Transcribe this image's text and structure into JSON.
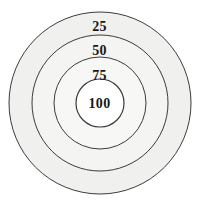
{
  "figure": {
    "type": "concentric-target-diagram",
    "background_color": "#ffffff",
    "stroke_color": "#3b3b3b",
    "canvas": {
      "width": 199,
      "height": 205
    }
  },
  "chart_data": {
    "type": "pie",
    "title": "",
    "subtitle": "",
    "xlabel": "",
    "ylabel": "",
    "legend": "none",
    "grid": false,
    "center": {
      "x": 100,
      "y": 103
    },
    "categories": [
      "25",
      "50",
      "75",
      "100"
    ],
    "values": [
      25,
      50,
      75,
      100
    ],
    "rings": [
      {
        "label": "25",
        "zone": "outermost",
        "radius": 91,
        "fill": "#f0f0ee",
        "stroke": "#3b3b3b",
        "label_position": {
          "x": 100,
          "y": 28
        }
      },
      {
        "label": "50",
        "zone": "second",
        "radius": 68,
        "fill": "#f4f4f2",
        "stroke": "#3b3b3b",
        "label_position": {
          "x": 100,
          "y": 52
        }
      },
      {
        "label": "75",
        "zone": "third",
        "radius": 46,
        "fill": "#f7f7f6",
        "stroke": "#3b3b3b",
        "label_position": {
          "x": 100,
          "y": 77
        }
      },
      {
        "label": "100",
        "zone": "bullseye",
        "radius": 24,
        "fill": "#ffffff",
        "stroke": "#3b3b3b",
        "label_position": {
          "x": 100,
          "y": 105
        }
      }
    ]
  },
  "labels": {
    "ring_outer": "25",
    "ring_second": "50",
    "ring_third": "75",
    "bullseye": "100"
  }
}
